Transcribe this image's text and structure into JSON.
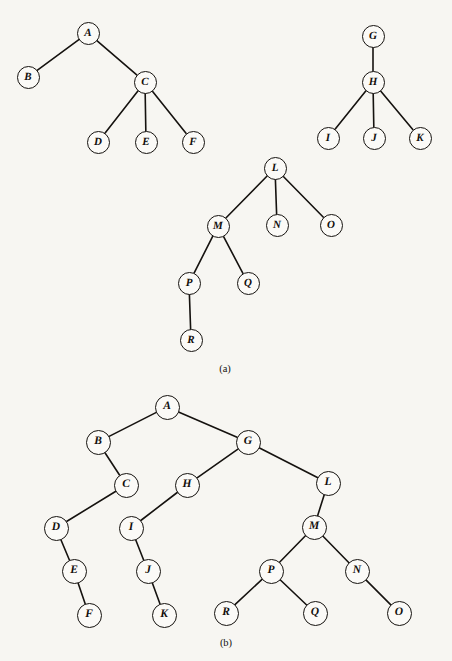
{
  "figure": {
    "type": "diagram",
    "diagram_kind": "forest-and-equivalent-binary-tree",
    "background_color": "#f7f6f2",
    "stroke_color": "#15120f",
    "node_fill_color": "#fbfaf7",
    "canvas": {
      "width": 452,
      "height": 661
    },
    "part_labels": [
      {
        "name": "part-a-label",
        "text": "(a)",
        "x": 225,
        "y": 368
      },
      {
        "name": "part-b-label",
        "text": "(b)",
        "x": 226,
        "y": 642
      }
    ],
    "parts": [
      {
        "id": "a",
        "caption": "(a)",
        "description": "A forest of three general (ordered) trees",
        "node_diameter": 23,
        "trees": [
          {
            "root": "A",
            "nodes": [
              "A",
              "B",
              "C",
              "D",
              "E",
              "F"
            ],
            "edges": [
              [
                "A",
                "B"
              ],
              [
                "A",
                "C"
              ],
              [
                "C",
                "D"
              ],
              [
                "C",
                "E"
              ],
              [
                "C",
                "F"
              ]
            ]
          },
          {
            "root": "G",
            "nodes": [
              "G",
              "H",
              "I",
              "J",
              "K"
            ],
            "edges": [
              [
                "G",
                "H"
              ],
              [
                "H",
                "I"
              ],
              [
                "H",
                "J"
              ],
              [
                "H",
                "K"
              ]
            ]
          },
          {
            "root": "L",
            "nodes": [
              "L",
              "M",
              "N",
              "O",
              "P",
              "Q",
              "R"
            ],
            "edges": [
              [
                "L",
                "M"
              ],
              [
                "L",
                "N"
              ],
              [
                "L",
                "O"
              ],
              [
                "M",
                "P"
              ],
              [
                "M",
                "Q"
              ],
              [
                "P",
                "R"
              ]
            ]
          }
        ],
        "nodes": [
          {
            "label": "A",
            "x": 88,
            "y": 33
          },
          {
            "label": "B",
            "x": 28,
            "y": 77
          },
          {
            "label": "C",
            "x": 145,
            "y": 82
          },
          {
            "label": "D",
            "x": 98,
            "y": 142
          },
          {
            "label": "E",
            "x": 146,
            "y": 142
          },
          {
            "label": "F",
            "x": 193,
            "y": 142
          },
          {
            "label": "G",
            "x": 373,
            "y": 36
          },
          {
            "label": "H",
            "x": 373,
            "y": 82
          },
          {
            "label": "I",
            "x": 328,
            "y": 138
          },
          {
            "label": "J",
            "x": 374,
            "y": 138
          },
          {
            "label": "K",
            "x": 420,
            "y": 138
          },
          {
            "label": "L",
            "x": 275,
            "y": 168
          },
          {
            "label": "M",
            "x": 218,
            "y": 226
          },
          {
            "label": "N",
            "x": 277,
            "y": 225
          },
          {
            "label": "O",
            "x": 331,
            "y": 225
          },
          {
            "label": "P",
            "x": 189,
            "y": 283
          },
          {
            "label": "Q",
            "x": 248,
            "y": 283
          },
          {
            "label": "R",
            "x": 191,
            "y": 340
          }
        ]
      },
      {
        "id": "b",
        "caption": "(b)",
        "description": "The corresponding binary tree (left child = first child, right child = next sibling)",
        "node_diameter": 25,
        "trees": [
          {
            "root": "A",
            "nodes": [
              "A",
              "B",
              "C",
              "D",
              "E",
              "F",
              "G",
              "H",
              "I",
              "J",
              "K",
              "L",
              "M",
              "N",
              "O",
              "P",
              "Q",
              "R"
            ],
            "edges": [
              [
                "A",
                "B"
              ],
              [
                "A",
                "G"
              ],
              [
                "B",
                "C"
              ],
              [
                "C",
                "D"
              ],
              [
                "D",
                "E"
              ],
              [
                "E",
                "F"
              ],
              [
                "G",
                "H"
              ],
              [
                "G",
                "L"
              ],
              [
                "H",
                "I"
              ],
              [
                "I",
                "J"
              ],
              [
                "J",
                "K"
              ],
              [
                "L",
                "M"
              ],
              [
                "M",
                "P"
              ],
              [
                "M",
                "N"
              ],
              [
                "P",
                "R"
              ],
              [
                "P",
                "Q"
              ],
              [
                "N",
                "O"
              ]
            ]
          }
        ],
        "nodes": [
          {
            "label": "A",
            "x": 167,
            "y": 407
          },
          {
            "label": "B",
            "x": 98,
            "y": 442
          },
          {
            "label": "G",
            "x": 248,
            "y": 442
          },
          {
            "label": "C",
            "x": 126,
            "y": 485
          },
          {
            "label": "H",
            "x": 187,
            "y": 485
          },
          {
            "label": "L",
            "x": 328,
            "y": 483
          },
          {
            "label": "D",
            "x": 56,
            "y": 528
          },
          {
            "label": "I",
            "x": 131,
            "y": 528
          },
          {
            "label": "M",
            "x": 314,
            "y": 527
          },
          {
            "label": "E",
            "x": 74,
            "y": 571
          },
          {
            "label": "J",
            "x": 148,
            "y": 571
          },
          {
            "label": "P",
            "x": 271,
            "y": 571
          },
          {
            "label": "N",
            "x": 357,
            "y": 571
          },
          {
            "label": "F",
            "x": 89,
            "y": 615
          },
          {
            "label": "K",
            "x": 164,
            "y": 615
          },
          {
            "label": "R",
            "x": 226,
            "y": 613
          },
          {
            "label": "Q",
            "x": 315,
            "y": 613
          },
          {
            "label": "O",
            "x": 399,
            "y": 613
          }
        ]
      }
    ]
  }
}
